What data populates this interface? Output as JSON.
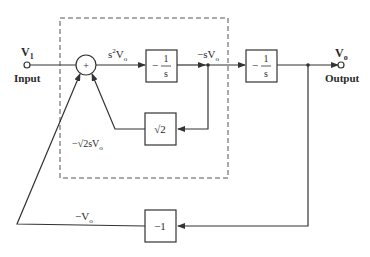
{
  "diagram": {
    "type": "block-diagram",
    "input": {
      "symbol": "V",
      "subscript": "1",
      "label": "Input"
    },
    "output": {
      "symbol": "V",
      "subscript": "o",
      "label": "Output"
    },
    "summing_junction": {
      "sign": "+"
    },
    "blocks": [
      {
        "id": "integrator-1",
        "gain_prefix": "−",
        "numerator": "1",
        "denominator": "s"
      },
      {
        "id": "integrator-2",
        "gain_prefix": "−",
        "numerator": "1",
        "denominator": "s"
      },
      {
        "id": "gain-sqrt2",
        "text": "√2"
      },
      {
        "id": "gain-neg1",
        "text": "−1"
      }
    ],
    "signals": {
      "after_sum": {
        "prefix": "s",
        "sup": "2",
        "main": "V",
        "sub": "o"
      },
      "after_int1": {
        "prefix": "−s",
        "main": "V",
        "sub": "o"
      },
      "sqrt2_out": {
        "prefix": "−√2s",
        "main": "V",
        "sub": "o"
      },
      "neg1_out": {
        "prefix": "−",
        "main": "V",
        "sub": "o"
      }
    },
    "colors": {
      "line": "#333333",
      "dashed_box": "#555555",
      "background": "#ffffff"
    }
  }
}
